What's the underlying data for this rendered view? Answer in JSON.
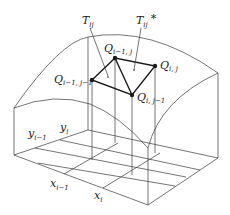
{
  "figure": {
    "labels": {
      "T_ij": {
        "main": "T",
        "sub": "ij"
      },
      "T_ij_star": {
        "main": "T",
        "sub": "ij",
        "sup": "*"
      },
      "Q_im1_j": {
        "main": "Q",
        "sub": "i−1, j"
      },
      "Q_i_j": {
        "main": "Q",
        "sub": "i, j"
      },
      "Q_im1_jm1": {
        "main": "Q",
        "sub": "i−1, j−1"
      },
      "Q_i_jm1": {
        "main": "Q",
        "sub": "i, j−1"
      },
      "y_im1": {
        "main": "y",
        "sub": "i−1"
      },
      "y_i": {
        "main": "y",
        "sub": "i"
      },
      "x_im1": {
        "main": "x",
        "sub": "i−1"
      },
      "x_i": {
        "main": "x",
        "sub": "i"
      }
    },
    "points": {
      "Q_im1_jm1": [
        92,
        80
      ],
      "Q_im1_j": [
        115,
        58
      ],
      "Q_i_j": [
        155,
        66
      ],
      "Q_i_jm1": [
        132,
        95
      ]
    },
    "colors": {
      "line": "#3a3a3a",
      "emphasis": "#1a1a1a",
      "background": "#ffffff"
    }
  }
}
